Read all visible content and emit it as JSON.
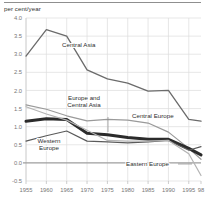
{
  "figure": {
    "y_unit_label": "per cent/year",
    "has_top_rule": true
  },
  "chart_data": {
    "type": "line",
    "title": "",
    "subtitle": "",
    "xlabel": "",
    "ylabel": "per cent/year",
    "x": [
      1955,
      1960,
      1965,
      1970,
      1975,
      1980,
      1985,
      1990,
      1995,
      1998
    ],
    "x_tick_labels": [
      "1955",
      "1960",
      "1965",
      "1970",
      "1975",
      "1980",
      "1985",
      "1990",
      "1995",
      "98"
    ],
    "y_tick_labels": [
      "4.0",
      "3.5",
      "3.0",
      "2.5",
      "2.0",
      "1.5",
      "1.0",
      "0.5",
      "0.0",
      "-0.5"
    ],
    "y_ticks": [
      4.0,
      3.5,
      3.0,
      2.5,
      2.0,
      1.5,
      1.0,
      0.5,
      0.0,
      -0.5
    ],
    "ylim": [
      -0.5,
      4.0
    ],
    "xlim": [
      1955,
      1998
    ],
    "grid": true,
    "zero_line": true,
    "legend_position": "inline-annotations",
    "series": [
      {
        "name": "Central Asia",
        "color": "#6b6b6b",
        "width": 1.3,
        "values": [
          2.95,
          3.68,
          3.5,
          2.57,
          2.32,
          2.2,
          1.98,
          2.0,
          1.2,
          1.15
        ],
        "label": "Central Asia",
        "label_x": 62,
        "label_y": 47,
        "leader": null
      },
      {
        "name": "Central Europe",
        "color": "#9a9a9a",
        "width": 1.2,
        "values": [
          1.6,
          1.48,
          1.3,
          1.16,
          1.2,
          1.18,
          1.1,
          0.85,
          0.4,
          0.1
        ],
        "label": "Central Europe",
        "label_x": 132,
        "label_y": 118,
        "leader": null
      },
      {
        "name": "Europe and Central Asia",
        "color": "#2b2b2b",
        "width": 3.0,
        "values": [
          1.15,
          1.22,
          1.2,
          0.82,
          0.78,
          0.7,
          0.65,
          0.65,
          0.4,
          0.22
        ],
        "label": "Europe and\nCentral Asia",
        "label_x": 84,
        "label_y": 100,
        "leader": {
          "x": 108,
          "y1": 117,
          "y2": 132
        }
      },
      {
        "name": "Western Europe",
        "color": "#5a5a5a",
        "width": 1.2,
        "values": [
          0.6,
          0.75,
          0.88,
          0.6,
          0.58,
          0.55,
          0.58,
          0.62,
          0.35,
          0.45
        ],
        "label": "Western\nEurope",
        "label_x": 49,
        "label_y": 143,
        "leader": null
      },
      {
        "name": "Eastern Europe",
        "color": "#b4b4b4",
        "width": 1.2,
        "values": [
          1.55,
          1.35,
          1.18,
          0.9,
          0.62,
          0.6,
          0.6,
          0.62,
          0.25,
          -0.35
        ],
        "label": "Eastern Europe",
        "label_x": 126,
        "label_y": 166,
        "leader": {
          "x1": 178,
          "x2": 192,
          "y": 164
        }
      }
    ]
  }
}
